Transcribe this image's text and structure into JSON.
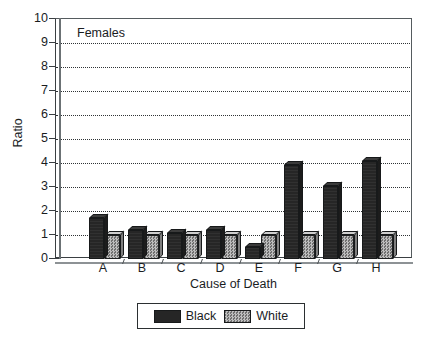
{
  "chart_data": {
    "type": "bar",
    "title": "",
    "annotation": "Females",
    "xlabel": "Cause of Death",
    "ylabel": "Ratio",
    "categories": [
      "A",
      "B",
      "C",
      "D",
      "E",
      "F",
      "G",
      "H"
    ],
    "series": [
      {
        "name": "Black",
        "values": [
          1.7,
          1.2,
          1.1,
          1.2,
          0.5,
          3.9,
          3.05,
          4.1
        ]
      },
      {
        "name": "White",
        "values": [
          1.0,
          1.0,
          1.0,
          1.0,
          1.0,
          1.0,
          1.0,
          1.0
        ]
      }
    ],
    "ylim": [
      0,
      10
    ],
    "ytick_labels": [
      "0",
      "1",
      "2",
      "3",
      "4",
      "5",
      "6",
      "7",
      "8",
      "9",
      "10"
    ],
    "grid": true,
    "legend_position": "bottom-center",
    "colors": {
      "black_series": "#262626",
      "white_series": "#9a9a9a",
      "axis": "#3a3f42",
      "grid": "#2f3335",
      "text": "#1a1d1f"
    }
  }
}
